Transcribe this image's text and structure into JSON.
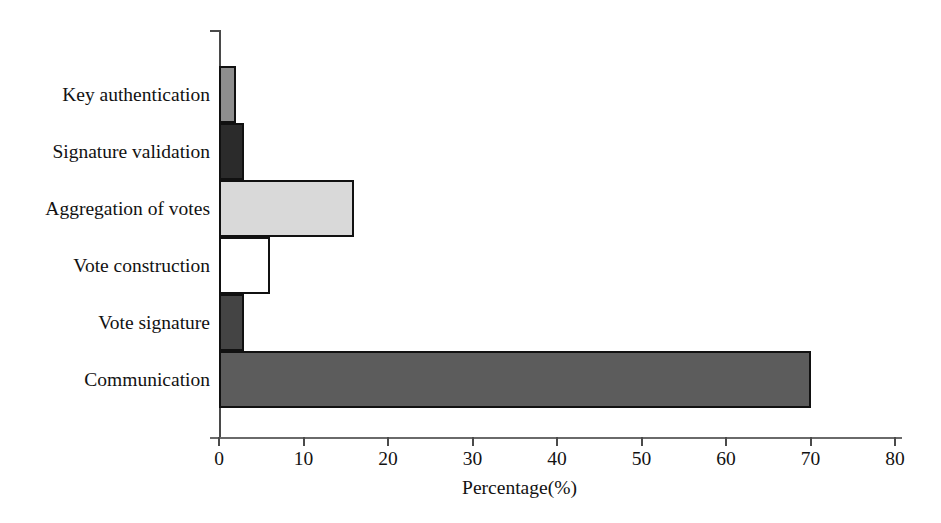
{
  "chart_data": {
    "type": "bar",
    "orientation": "horizontal",
    "title": "",
    "xlabel": "Percentage(%)",
    "ylabel": "",
    "xlim": [
      0,
      80
    ],
    "ylim": null,
    "grid": false,
    "legend": null,
    "xticks": [
      0,
      10,
      20,
      30,
      40,
      50,
      60,
      70,
      80
    ],
    "categories": [
      "Key authentication",
      "Signature validation",
      "Aggregation of votes",
      "Vote construction",
      "Vote signature",
      "Communication"
    ],
    "values": [
      2,
      3,
      16,
      6,
      3,
      70
    ],
    "bar_colors": [
      "#8e8e8e",
      "#2b2b2b",
      "#d9d9d9",
      "#ffffff",
      "#444444",
      "#5c5c5c"
    ],
    "bar_edge_color": "#111111",
    "axis_color": "#4a4a4a",
    "background_color": "#ffffff"
  }
}
